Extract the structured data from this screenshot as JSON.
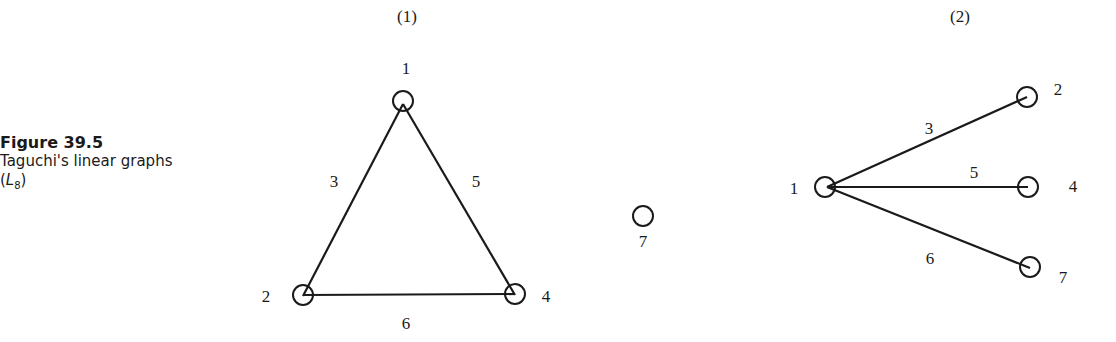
{
  "caption": {
    "figure_number": "Figure 39.5",
    "description": "Taguchi's linear graphs",
    "subtitle_open": "(",
    "subtitle_var": "L",
    "subtitle_sub": "8",
    "subtitle_close": ")"
  },
  "graphs": [
    {
      "title": "(1)",
      "nodes": [
        {
          "id": "1",
          "label": "1"
        },
        {
          "id": "2",
          "label": "2"
        },
        {
          "id": "4",
          "label": "4"
        },
        {
          "id": "7",
          "label": "7"
        }
      ],
      "edges": [
        {
          "from": "1",
          "to": "2",
          "label": "3"
        },
        {
          "from": "1",
          "to": "4",
          "label": "5"
        },
        {
          "from": "2",
          "to": "4",
          "label": "6"
        }
      ]
    },
    {
      "title": "(2)",
      "nodes": [
        {
          "id": "1",
          "label": "1"
        },
        {
          "id": "2",
          "label": "2"
        },
        {
          "id": "4",
          "label": "4"
        },
        {
          "id": "7",
          "label": "7"
        }
      ],
      "edges": [
        {
          "from": "1",
          "to": "2",
          "label": "3"
        },
        {
          "from": "1",
          "to": "4",
          "label": "5"
        },
        {
          "from": "1",
          "to": "7",
          "label": "6"
        }
      ]
    }
  ]
}
